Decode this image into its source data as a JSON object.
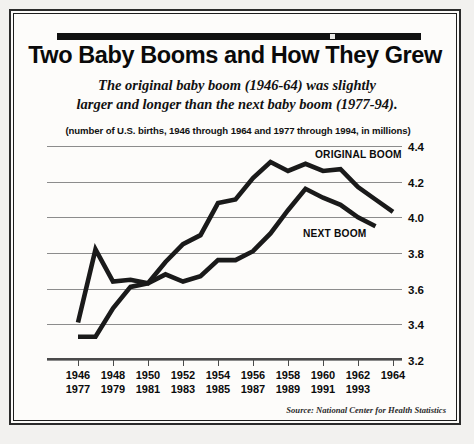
{
  "headline": "Two Baby Booms and How They Grew",
  "deck_line_1": "The original baby boom (1946-64) was slightly",
  "deck_line_2": "larger and longer than the next baby boom (1977-94).",
  "units_note": "(number of U.S. births, 1946 through 1964 and 1977 through 1994, in millions)",
  "source": "Source: National Center for Health Statistics",
  "labels": {
    "original_boom": "ORIGINAL BOOM",
    "next_boom": "NEXT BOOM"
  },
  "colors": {
    "ink": "#0a0a0a",
    "line": "#1a1a1a",
    "grid": "#8c8c8c",
    "paper": "#fdfcfa"
  },
  "chart_data": {
    "type": "line",
    "title": "Two Baby Booms and How They Grew",
    "subtitle": "The original baby boom (1946-64) was slightly larger and longer than the next baby boom (1977-94).",
    "xlabel": "",
    "ylabel": "(number of U.S. births, in millions)",
    "ylim": [
      3.2,
      4.4
    ],
    "ytick_labels": [
      "4.4",
      "4.2",
      "4.0",
      "3.8",
      "3.6",
      "3.4",
      "3.2"
    ],
    "ytick_values": [
      4.4,
      4.2,
      4.0,
      3.8,
      3.6,
      3.4,
      3.2
    ],
    "grid": true,
    "legend_position": "inline-annotation",
    "x_index": [
      0,
      1,
      2,
      3,
      4,
      5,
      6,
      7,
      8,
      9,
      10,
      11,
      12,
      13,
      14,
      15,
      16,
      17,
      18
    ],
    "xtick_index": [
      0,
      2,
      4,
      6,
      8,
      10,
      12,
      14,
      16,
      18
    ],
    "xtick_labels_row1": [
      "1946",
      "1948",
      "1950",
      "1952",
      "1954",
      "1956",
      "1958",
      "1960",
      "1962",
      "1964"
    ],
    "xtick_labels_row2": [
      "1977",
      "1979",
      "1981",
      "1983",
      "1985",
      "1987",
      "1989",
      "1991",
      "1993",
      ""
    ],
    "series": [
      {
        "name": "ORIGINAL BOOM",
        "years": [
          1946,
          1947,
          1948,
          1949,
          1950,
          1951,
          1952,
          1953,
          1954,
          1955,
          1956,
          1957,
          1958,
          1959,
          1960,
          1961,
          1962,
          1963,
          1964
        ],
        "values": [
          3.41,
          3.82,
          3.64,
          3.65,
          3.63,
          3.75,
          3.85,
          3.9,
          4.08,
          4.1,
          4.22,
          4.31,
          4.26,
          4.3,
          4.26,
          4.27,
          4.17,
          4.1,
          4.03
        ]
      },
      {
        "name": "NEXT BOOM",
        "years": [
          1977,
          1978,
          1979,
          1980,
          1981,
          1982,
          1983,
          1984,
          1985,
          1986,
          1987,
          1988,
          1989,
          1990,
          1991,
          1992,
          1993,
          1994
        ],
        "values": [
          3.33,
          3.33,
          3.49,
          3.61,
          3.63,
          3.68,
          3.64,
          3.67,
          3.76,
          3.76,
          3.81,
          3.91,
          4.04,
          4.16,
          4.11,
          4.07,
          4.0,
          3.95
        ]
      }
    ]
  }
}
